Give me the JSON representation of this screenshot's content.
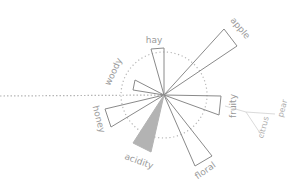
{
  "diagram": {
    "type": "flavor-rose",
    "center": [
      164,
      95
    ],
    "reference_circle_radius": 43,
    "colors": {
      "stroke": "#8a8a8a",
      "dotted": "#b5b5b5",
      "filled": "#b3b3b3",
      "label": "#9a9a9a",
      "branch": "#d0d0d0"
    },
    "wedges": [
      {
        "name": "hay",
        "label": "hay",
        "p1": [
          151,
          49
        ],
        "p2": [
          164,
          48
        ],
        "filled": false,
        "label_pos": [
          154,
          43
        ],
        "label_rot": 0
      },
      {
        "name": "apple",
        "label": "apple",
        "p1": [
          224,
          29
        ],
        "p2": [
          237,
          46
        ],
        "filled": false,
        "label_pos": [
          238,
          30
        ],
        "label_rot": 50
      },
      {
        "name": "woody",
        "label": "woody",
        "p1": [
          135,
          80
        ],
        "p2": [
          133,
          90
        ],
        "filled": false,
        "label_pos": [
          116,
          73
        ],
        "label_rot": -65
      },
      {
        "name": "fruity",
        "label": "fruity",
        "p1": [
          221,
          96
        ],
        "p2": [
          219,
          115
        ],
        "filled": false,
        "label_pos": [
          236,
          106
        ],
        "label_rot": -90
      },
      {
        "name": "honey",
        "label": "honey",
        "p1": [
          105,
          109
        ],
        "p2": [
          111,
          127
        ],
        "filled": false,
        "label_pos": [
          96,
          120
        ],
        "label_rot": 75
      },
      {
        "name": "acidity",
        "label": "acidity",
        "p1": [
          133,
          143
        ],
        "p2": [
          151,
          152
        ],
        "filled": true,
        "label_pos": [
          138,
          164
        ],
        "label_rot": 20
      },
      {
        "name": "floral",
        "label": "floral",
        "p1": [
          195,
          166
        ],
        "p2": [
          212,
          156
        ],
        "filled": false,
        "label_pos": [
          207,
          173
        ],
        "label_rot": -35
      }
    ],
    "baseline": {
      "from": [
        0,
        96
      ],
      "to": [
        164,
        95
      ]
    },
    "sub_branches": {
      "origin": [
        225,
        106
      ],
      "hub": [
        246,
        112
      ],
      "items": [
        {
          "label": "citrus",
          "end": [
            262,
            136
          ],
          "label_pos": [
            266,
            128
          ],
          "label_rot": -75
        },
        {
          "label": "pear",
          "end": [
            275,
            114
          ],
          "label_pos": [
            285,
            109
          ],
          "label_rot": -75
        }
      ]
    }
  }
}
